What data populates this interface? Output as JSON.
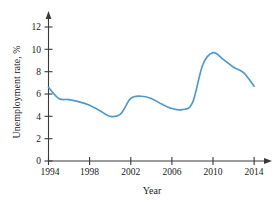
{
  "chart_data": {
    "type": "line",
    "title": "",
    "xlabel": "Year",
    "ylabel": "Unemployment rate, %",
    "xlim": [
      1994,
      2015
    ],
    "ylim": [
      0,
      13
    ],
    "xticks": [
      1994,
      1998,
      2002,
      2006,
      2010,
      2014
    ],
    "xtick_labels": [
      "1994",
      "1998",
      "2002",
      "2006",
      "2010",
      "2014"
    ],
    "yticks": [
      0,
      2,
      4,
      6,
      8,
      10,
      12
    ],
    "ytick_labels": [
      "0",
      "2",
      "4",
      "6",
      "8",
      "10",
      "12"
    ],
    "grid": false,
    "legend": null,
    "line_color": "#4E9BCB",
    "axis_color": "#3a3a3a",
    "x": [
      1994,
      1995,
      1996,
      1997,
      1998,
      1999,
      2000,
      2001,
      2002,
      2003,
      2004,
      2005,
      2006,
      2007,
      2008,
      2009,
      2010,
      2011,
      2012,
      2013,
      2014
    ],
    "values": [
      6.6,
      5.6,
      5.5,
      5.3,
      5.0,
      4.5,
      4.0,
      4.2,
      5.6,
      5.8,
      5.6,
      5.1,
      4.7,
      4.6,
      5.2,
      8.6,
      9.7,
      9.1,
      8.4,
      7.9,
      6.7
    ],
    "series": [
      {
        "name": "Unemployment rate",
        "color": "#4E9BCB",
        "values": [
          6.6,
          5.6,
          5.5,
          5.3,
          5.0,
          4.5,
          4.0,
          4.2,
          5.6,
          5.8,
          5.6,
          5.1,
          4.7,
          4.6,
          5.2,
          8.6,
          9.7,
          9.1,
          8.4,
          7.9,
          6.7
        ]
      }
    ],
    "annotations": []
  }
}
